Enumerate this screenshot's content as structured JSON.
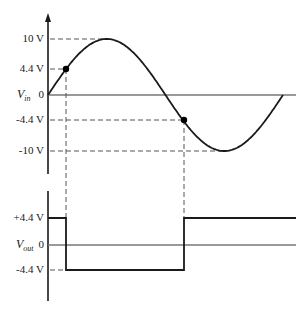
{
  "diagram": {
    "top_plot": {
      "axis_label": "V",
      "axis_label_sub": "in",
      "zero_label": "0",
      "ticks": [
        {
          "label": "10 V",
          "value": 10
        },
        {
          "label": "4.4 V",
          "value": 4.4
        },
        {
          "label": "-4.4 V",
          "value": -4.4
        },
        {
          "label": "-10 V",
          "value": -10
        }
      ],
      "signal": "sine",
      "amplitude_v": 10,
      "threshold_points": [
        {
          "value": 4.4,
          "phase": "rising"
        },
        {
          "value": -4.4,
          "phase": "falling"
        }
      ]
    },
    "bottom_plot": {
      "axis_label": "V",
      "axis_label_sub": "out",
      "zero_label": "0",
      "ticks": [
        {
          "label": "+4.4 V",
          "value": 4.4
        },
        {
          "label": "-4.4 V",
          "value": -4.4
        }
      ],
      "signal": "square",
      "levels": [
        "+4.4 V",
        "-4.4 V",
        "+4.4 V"
      ]
    },
    "colors": {
      "curve": "#1a1a1a",
      "axis": "#1a1a1a",
      "zero_line": "#777777",
      "dashed": "#555555"
    }
  }
}
